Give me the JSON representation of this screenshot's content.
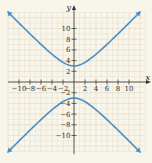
{
  "chart_data": {
    "type": "line",
    "title": "",
    "xlabel": "x",
    "ylabel": "y",
    "equation_hint": "hyperbola with vertices at (0,3) and (0,-3), opening up and down",
    "xlim": [
      -12,
      13
    ],
    "ylim": [
      -13,
      13
    ],
    "grid": true,
    "x_ticks": [
      -10,
      -8,
      -6,
      -4,
      -2,
      2,
      4,
      6,
      8,
      10
    ],
    "x_tick_labels": [
      "−10",
      "−8",
      "−6",
      "−4",
      "−2",
      "2",
      "4",
      "6",
      "8",
      "10"
    ],
    "y_ticks": [
      10,
      8,
      6,
      4,
      2,
      -2,
      -4,
      -6,
      -8,
      -10
    ],
    "y_tick_labels": [
      "10",
      "8",
      "6",
      "4",
      "2",
      "−2",
      "−4",
      "−6",
      "−8",
      "−10"
    ],
    "series": [
      {
        "name": "upper branch",
        "color": "#4a8fc4",
        "x": [
          -12,
          -10,
          -8,
          -6,
          -4,
          -2,
          0,
          2,
          4,
          6,
          8,
          10,
          12
        ],
        "y": [
          13.1,
          11.0,
          8.9,
          7.0,
          5.2,
          3.7,
          3.0,
          3.7,
          5.2,
          7.0,
          8.9,
          11.0,
          13.1
        ]
      },
      {
        "name": "lower branch",
        "color": "#4a8fc4",
        "x": [
          -12,
          -10,
          -8,
          -6,
          -4,
          -2,
          0,
          2,
          4,
          6,
          8,
          10,
          12
        ],
        "y": [
          -13.1,
          -11.0,
          -8.9,
          -7.0,
          -5.2,
          -3.7,
          -3.0,
          -3.7,
          -5.2,
          -7.0,
          -8.9,
          -11.0,
          -13.1
        ]
      }
    ],
    "vertices": [
      [
        0,
        3
      ],
      [
        0,
        -3
      ]
    ],
    "colors": {
      "background": "#f8f5ea",
      "grid": "#e3dccb",
      "axis": "#333333",
      "curve": "#4a8fc4"
    }
  }
}
